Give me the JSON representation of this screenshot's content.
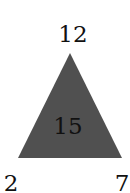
{
  "diagram": {
    "type": "number-triangle",
    "colors": {
      "triangle_fill": "#505050",
      "text": "#111111",
      "background": "#ffffff"
    },
    "top_label": "12",
    "center_label": "15",
    "bottom_left_label": "2",
    "bottom_right_label": "7"
  }
}
